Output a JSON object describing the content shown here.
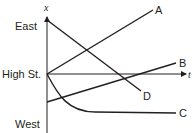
{
  "diagram": {
    "type": "position-time graph",
    "axes": {
      "y_label": "x",
      "x_label": "t",
      "y_ticks": [
        "East",
        "High St.",
        "West"
      ]
    },
    "lines": [
      {
        "label": "A",
        "description": "starts at High St., moves east (increasing x)"
      },
      {
        "label": "B",
        "description": "starts west of High St., moves east, crosses High St."
      },
      {
        "label": "C",
        "description": "starts at High St., moves west, slows to rest"
      },
      {
        "label": "D",
        "description": "starts east, moves west, crosses High St."
      }
    ]
  },
  "colors": {
    "ink": "#231f20",
    "background": "#ffffff"
  }
}
